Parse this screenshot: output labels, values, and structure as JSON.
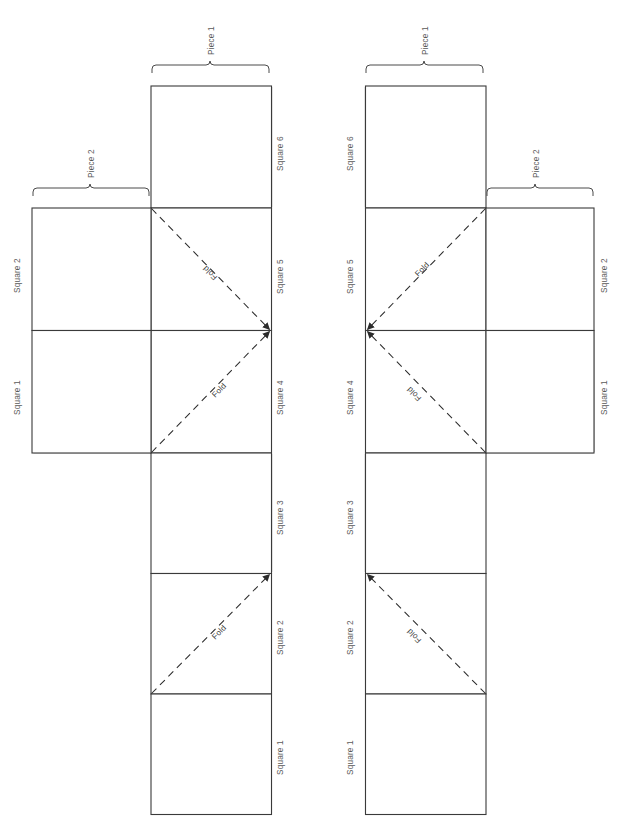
{
  "diagram": {
    "fold_label": "Fold",
    "nets": [
      {
        "id": "left-net",
        "name": "left-cube-net",
        "mirrored": false,
        "pieces": [
          {
            "label": "Piece 1",
            "covers": "Square 6"
          },
          {
            "label": "Piece 2",
            "covers": "Square 2 and Square 1"
          }
        ],
        "squares": [
          {
            "label": "Square 6",
            "column": "main",
            "row": 0
          },
          {
            "label": "Square 5",
            "column": "main",
            "row": 1
          },
          {
            "label": "Square 4",
            "column": "main",
            "row": 2
          },
          {
            "label": "Square 3",
            "column": "main",
            "row": 3
          },
          {
            "label": "Square 2",
            "column": "main",
            "row": 4
          },
          {
            "label": "Square 1",
            "column": "main",
            "row": 5
          },
          {
            "label": "Square 2",
            "column": "side",
            "row": 1
          },
          {
            "label": "Square 1",
            "column": "side",
            "row": 2
          }
        ],
        "folds": [
          {
            "label": "Fold",
            "on": "Square 5"
          },
          {
            "label": "Fold",
            "on": "Square 4"
          },
          {
            "label": "Fold",
            "on": "Square 2"
          }
        ]
      },
      {
        "id": "right-net",
        "name": "right-cube-net",
        "mirrored": true,
        "pieces": [
          {
            "label": "Piece 1",
            "covers": "Square 6"
          },
          {
            "label": "Piece 2",
            "covers": "Square 2 and Square 1"
          }
        ],
        "squares": [
          {
            "label": "Square 6",
            "column": "main",
            "row": 0
          },
          {
            "label": "Square 5",
            "column": "main",
            "row": 1
          },
          {
            "label": "Square 4",
            "column": "main",
            "row": 2
          },
          {
            "label": "Square 3",
            "column": "main",
            "row": 3
          },
          {
            "label": "Square 2",
            "column": "main",
            "row": 4
          },
          {
            "label": "Square 1",
            "column": "main",
            "row": 5
          },
          {
            "label": "Square 2",
            "column": "side",
            "row": 1
          },
          {
            "label": "Square 1",
            "column": "side",
            "row": 2
          }
        ],
        "folds": [
          {
            "label": "Fold",
            "on": "Square 5"
          },
          {
            "label": "Fold",
            "on": "Square 4"
          },
          {
            "label": "Fold",
            "on": "Square 2"
          }
        ]
      }
    ],
    "colors": {
      "outline": "#3a3a3a",
      "thick_edge": "#8c8c8c",
      "light_edge": "#cfcfcf",
      "label_text": "#595959",
      "fold_text": "#3d3d3d",
      "background": "#ffffff"
    }
  },
  "left": {
    "piece1": "Piece 1",
    "piece2": "Piece 2",
    "sq6": "Square 6",
    "sq5": "Square 5",
    "sq4": "Square 4",
    "sq3": "Square 3",
    "sq2": "Square 2",
    "sq1": "Square 1",
    "side_sq2": "Square 2",
    "side_sq1": "Square 1",
    "fold_a": "Fold",
    "fold_b": "Fold",
    "fold_c": "Fold"
  },
  "right": {
    "piece1": "Piece 1",
    "piece2": "Piece 2",
    "sq6": "Square 6",
    "sq5": "Square 5",
    "sq4": "Square 4",
    "sq3": "Square 3",
    "sq2": "Square 2",
    "sq1": "Square 1",
    "side_sq2": "Square 2",
    "side_sq1": "Square 1",
    "fold_a": "Fold",
    "fold_b": "Fold",
    "fold_c": "Fold"
  }
}
